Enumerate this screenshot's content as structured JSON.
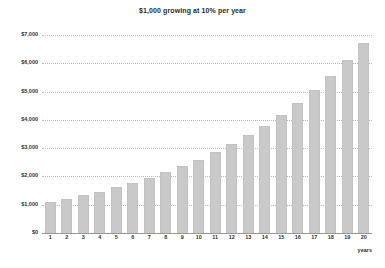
{
  "chart_data": {
    "type": "bar",
    "title": "$1,000 growing at 10% per year",
    "xlabel": "years",
    "ylabel": "",
    "categories": [
      "1",
      "2",
      "3",
      "4",
      "5",
      "6",
      "7",
      "8",
      "9",
      "10",
      "11",
      "12",
      "13",
      "14",
      "15",
      "16",
      "17",
      "18",
      "19",
      "20"
    ],
    "values": [
      1100,
      1210,
      1331,
      1464,
      1611,
      1772,
      1949,
      2144,
      2358,
      2594,
      2853,
      3138,
      3452,
      3797,
      4177,
      4595,
      5054,
      5560,
      6116,
      6727
    ],
    "ylim": [
      0,
      7000
    ],
    "xlim_labels": [
      "1",
      "20"
    ],
    "ytick_labels": [
      "$0",
      "$1,000",
      "$2,000",
      "$3,000",
      "$4,000",
      "$5,000",
      "$6,000",
      "$7,000"
    ],
    "ytick_values": [
      0,
      1000,
      2000,
      3000,
      4000,
      5000,
      6000,
      7000
    ],
    "grid": true,
    "legend": "none",
    "bar_color": "#c9c9c9",
    "gridline_color": "#b9b9b9",
    "axis_color": "#999999",
    "background_color": "#ffffff",
    "text_color": "#333333"
  }
}
